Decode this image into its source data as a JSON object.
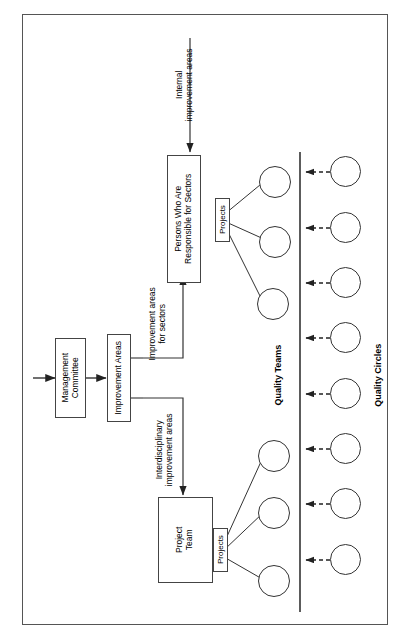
{
  "diagram": {
    "orientation": "rotated-90-ccw",
    "nodes": {
      "management_committee": "Management\nCommittee",
      "management_committee_line1": "Management",
      "management_committee_line2": "Committee",
      "improvement_areas": "Improvement Areas",
      "persons_responsible_line1": "Persons Who Are",
      "persons_responsible_line2": "Responsible for Sectors",
      "project_team_line1": "Project",
      "project_team_line2": "Team",
      "projects_top": "Projects",
      "projects_bottom": "Projects"
    },
    "edge_labels": {
      "internal_line1": "Internal",
      "internal_line2": "improvement areas",
      "sectors_line1": "Improvement areas",
      "sectors_line2": "for sectors",
      "interdisciplinary_line1": "Interdisciplinary",
      "interdisciplinary_line2": "improvement areas"
    },
    "group_labels": {
      "quality_teams": "Quality Teams",
      "quality_circles": "Quality Circles"
    },
    "counts": {
      "quality_teams": 6,
      "quality_circles": 8,
      "quality_teams_upper_group": 3,
      "quality_teams_lower_group": 3
    },
    "colors": {
      "frame_stroke": "#555555",
      "node_stroke": "#444444",
      "circle_stroke": "#333333",
      "line": "#333333",
      "dashed_arrow": "#333333",
      "background": "#ffffff",
      "text": "#000000"
    }
  }
}
